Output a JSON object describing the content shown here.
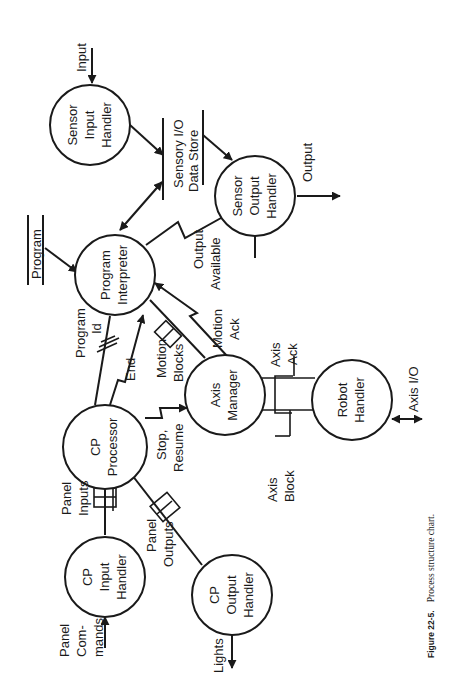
{
  "figure": {
    "caption_label": "Figure 22-5.",
    "caption_text": "Process structure chart.",
    "orientation": "rotated 90 degrees counter-clockwise"
  },
  "processes": [
    {
      "id": "sensor_input",
      "lines": [
        "Sensor",
        "Input",
        "Handler"
      ]
    },
    {
      "id": "sensor_output",
      "lines": [
        "Sensor",
        "Output",
        "Handler"
      ]
    },
    {
      "id": "program_interpreter",
      "lines": [
        "Program",
        "Interpreter"
      ]
    },
    {
      "id": "cp_processor",
      "lines": [
        "CP",
        "Processor"
      ]
    },
    {
      "id": "axis_manager",
      "lines": [
        "Axis",
        "Manager"
      ]
    },
    {
      "id": "robot_handler",
      "lines": [
        "Robot",
        "Handler"
      ]
    },
    {
      "id": "cp_input",
      "lines": [
        "CP",
        "Input",
        "Handler"
      ]
    },
    {
      "id": "cp_output",
      "lines": [
        "CP",
        "Output",
        "Handler"
      ]
    }
  ],
  "data_stores": [
    {
      "id": "sensory_io",
      "lines": [
        "Sensory I/O",
        "Data Store"
      ]
    },
    {
      "id": "program",
      "lines": [
        "Program"
      ]
    }
  ],
  "flows": {
    "input": "Input",
    "output": "Output",
    "output_available": [
      "Output",
      "Available"
    ],
    "program_id": [
      "Program",
      "Id"
    ],
    "end": "End",
    "motion_blocks": [
      "Motion",
      "Blocks"
    ],
    "motion_ack": [
      "Motion",
      "Ack"
    ],
    "stop_resume": [
      "Stop,",
      "Resume"
    ],
    "axis_ack": [
      "Axis",
      "Ack"
    ],
    "axis_block": [
      "Axis",
      "Block"
    ],
    "axis_io": "Axis I/O",
    "panel_inputs": [
      "Panel",
      "Inputs"
    ],
    "panel_outputs": [
      "Panel",
      "Outputs"
    ],
    "panel_commands": [
      "Panel",
      "Com-",
      "mands"
    ],
    "lights": "Lights"
  }
}
